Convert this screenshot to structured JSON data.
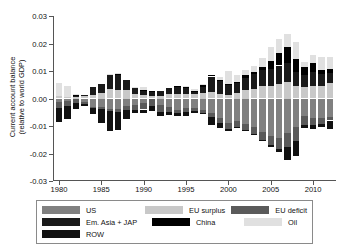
{
  "chart_data": {
    "type": "bar",
    "title": "",
    "xlabel": "",
    "ylabel": "Current account balance (relative to world GDP)",
    "ylabel_line1": "Current account balance",
    "ylabel_line2": "(relative to world GDP)",
    "stacked": true,
    "grid": false,
    "legend_position": "below",
    "ylim": [
      -0.03,
      0.03
    ],
    "yticks": [
      0.03,
      0.02,
      0.01,
      0.0,
      -0.01,
      -0.02,
      -0.03
    ],
    "ytick_labels": [
      "0.03",
      "0.02",
      "0.01",
      "0.00",
      "-0.01",
      "-0.02",
      "-0.03"
    ],
    "xticks": [
      1980,
      1985,
      1990,
      1995,
      2000,
      2005,
      2010
    ],
    "xtick_labels": [
      "1980",
      "1985",
      "1990",
      "1995",
      "2000",
      "2005",
      "2010"
    ],
    "xlim": [
      1979.3,
      2012.7
    ],
    "categories": [
      1980,
      1981,
      1982,
      1983,
      1984,
      1985,
      1986,
      1987,
      1988,
      1989,
      1990,
      1991,
      1992,
      1993,
      1994,
      1995,
      1996,
      1997,
      1998,
      1999,
      2000,
      2001,
      2002,
      2003,
      2004,
      2005,
      2006,
      2007,
      2008,
      2009,
      2010,
      2011,
      2012
    ],
    "series": [
      {
        "name": "US",
        "color": "#808080",
        "sign": "negative",
        "values": [
          -0.0012,
          -0.0008,
          -0.0002,
          -0.0012,
          -0.003,
          -0.0032,
          -0.0039,
          -0.0039,
          -0.0028,
          -0.0023,
          -0.0018,
          -0.0002,
          -0.0022,
          -0.0031,
          -0.004,
          -0.0036,
          -0.0035,
          -0.004,
          -0.0053,
          -0.007,
          -0.009,
          -0.0082,
          -0.0092,
          -0.0105,
          -0.0122,
          -0.0135,
          -0.0143,
          -0.0125,
          -0.0105,
          -0.0065,
          -0.0072,
          -0.007,
          -0.0066
        ]
      },
      {
        "name": "EU deficit",
        "color": "#5a5a5a",
        "sign": "negative",
        "values": [
          -0.0022,
          -0.0018,
          -0.0013,
          -0.0007,
          -0.0006,
          -0.0007,
          -0.0007,
          -0.001,
          -0.0013,
          -0.0018,
          -0.0022,
          -0.0026,
          -0.0028,
          -0.0018,
          -0.0014,
          -0.0012,
          -0.0012,
          -0.0012,
          -0.0014,
          -0.0018,
          -0.0022,
          -0.0022,
          -0.0022,
          -0.0025,
          -0.0028,
          -0.0034,
          -0.0042,
          -0.0052,
          -0.005,
          -0.0032,
          -0.0026,
          -0.0022,
          -0.0014
        ]
      },
      {
        "name": "ROW",
        "color": "#111111",
        "sign": "negative",
        "values": [
          -0.005,
          -0.0048,
          -0.0022,
          -0.001,
          -0.0022,
          -0.005,
          -0.0073,
          -0.0065,
          -0.0035,
          -0.0012,
          -0.0012,
          -0.0016,
          -0.0014,
          -0.001,
          -0.001,
          -0.0014,
          -0.0006,
          -0.0004,
          -0.003,
          -0.0018,
          -0.0006,
          -0.0004,
          -0.0004,
          -0.0004,
          -0.0004,
          -0.0006,
          -0.001,
          -0.0048,
          -0.0054,
          -0.001,
          -0.0012,
          -0.001,
          -0.003
        ]
      },
      {
        "name": "EU surplus",
        "color": "#c8c8c8",
        "sign": "positive",
        "values": [
          0.0008,
          0.0006,
          0.0005,
          0.0008,
          0.0014,
          0.002,
          0.0036,
          0.0032,
          0.003,
          0.0018,
          0.0012,
          0.0008,
          0.001,
          0.0016,
          0.0018,
          0.0018,
          0.0018,
          0.002,
          0.0024,
          0.0018,
          0.0014,
          0.002,
          0.003,
          0.0036,
          0.0044,
          0.0046,
          0.0054,
          0.006,
          0.0046,
          0.0042,
          0.0046,
          0.0046,
          0.0058
        ]
      },
      {
        "name": "Em. Asia + JAP",
        "color": "#1a1a1a",
        "sign": "positive",
        "values": [
          0.0,
          0.0,
          0.0004,
          0.0006,
          0.0028,
          0.0034,
          0.0052,
          0.0056,
          0.0038,
          0.002,
          0.0016,
          0.0014,
          0.0018,
          0.0024,
          0.0024,
          0.002,
          0.0008,
          0.0022,
          0.0056,
          0.0044,
          0.0036,
          0.0036,
          0.0046,
          0.0052,
          0.0058,
          0.0062,
          0.0066,
          0.007,
          0.005,
          0.0044,
          0.0052,
          0.0042,
          0.0036
        ]
      },
      {
        "name": "China",
        "color": "#000000",
        "sign": "positive",
        "values": [
          0.0,
          0.0,
          0.0002,
          0.0,
          0.0,
          0.0,
          0.0,
          0.0002,
          0.0,
          0.0,
          0.0004,
          0.0004,
          0.0,
          0.0,
          0.0004,
          0.0004,
          0.0002,
          0.0006,
          0.0006,
          0.0004,
          0.0004,
          0.0004,
          0.0008,
          0.001,
          0.0014,
          0.003,
          0.0046,
          0.0056,
          0.0048,
          0.003,
          0.003,
          0.0016,
          0.0014
        ]
      },
      {
        "name": "Oil",
        "color": "#e0e0e0",
        "sign": "positive",
        "values": [
          0.0048,
          0.004,
          0.0004,
          0.0,
          0.0,
          0.0,
          0.0002,
          0.0004,
          0.0,
          0.0004,
          0.001,
          0.0,
          0.0,
          0.0,
          0.0,
          0.0002,
          0.0006,
          0.0004,
          0.0,
          0.0012,
          0.0046,
          0.0026,
          0.0018,
          0.0022,
          0.003,
          0.0048,
          0.0052,
          0.005,
          0.006,
          0.0018,
          0.0032,
          0.0048,
          0.0044
        ]
      }
    ]
  },
  "legend": {
    "entries": [
      {
        "label": "US",
        "color": "#808080"
      },
      {
        "label": "EU surplus",
        "color": "#c8c8c8"
      },
      {
        "label": "EU deficit",
        "color": "#5a5a5a"
      },
      {
        "label": "Em. Asia + JAP",
        "color": "#1a1a1a"
      },
      {
        "label": "China",
        "color": "#000000"
      },
      {
        "label": "Oil",
        "color": "#e0e0e0"
      },
      {
        "label": "ROW",
        "color": "#111111"
      }
    ]
  }
}
